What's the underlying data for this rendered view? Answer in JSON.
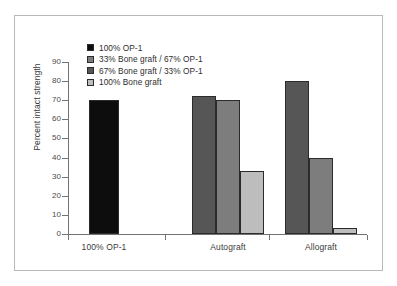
{
  "chart_data": {
    "type": "bar",
    "title": "",
    "xlabel": "",
    "ylabel": "Percent intact strength",
    "ylim": [
      0,
      90
    ],
    "ytick_step": 10,
    "yticks": [
      90,
      80,
      70,
      60,
      50,
      40,
      30,
      20,
      10,
      0
    ],
    "grid": false,
    "legend_position": "top-left",
    "categories": [
      "100% OP-1",
      "Autograft",
      "Allograft"
    ],
    "series": [
      {
        "name": "100% OP-1",
        "color": "#0d0d0d",
        "values": [
          70,
          null,
          null
        ]
      },
      {
        "name": "33% Bone graft / 67% OP-1",
        "color": "#7d7d7d",
        "values": [
          null,
          70,
          40
        ]
      },
      {
        "name": "67% Bone graft / 33% OP-1",
        "color": "#565656",
        "values": [
          null,
          72,
          80
        ]
      },
      {
        "name": "100% Bone graft",
        "color": "#bdbdbd",
        "values": [
          null,
          33,
          3
        ]
      }
    ],
    "bars": [
      {
        "category": "100% OP-1",
        "series": "100% OP-1",
        "value": 70,
        "color": "#0d0d0d",
        "x": 74,
        "width": 30
      },
      {
        "category": "Autograft",
        "series": "67% Bone graft / 33% OP-1",
        "value": 72,
        "color": "#565656",
        "x": 177,
        "width": 24
      },
      {
        "category": "Autograft",
        "series": "33% Bone graft / 67% OP-1",
        "value": 70,
        "color": "#7d7d7d",
        "x": 201,
        "width": 24
      },
      {
        "category": "Autograft",
        "series": "100% Bone graft",
        "value": 33,
        "color": "#bdbdbd",
        "x": 225,
        "width": 24
      },
      {
        "category": "Allograft",
        "series": "67% Bone graft / 33% OP-1",
        "value": 80,
        "color": "#565656",
        "x": 270,
        "width": 24
      },
      {
        "category": "Allograft",
        "series": "33% Bone graft / 67% OP-1",
        "value": 40,
        "color": "#7d7d7d",
        "x": 294,
        "width": 24
      },
      {
        "category": "Allograft",
        "series": "100% Bone graft",
        "value": 3,
        "color": "#bdbdbd",
        "x": 318,
        "width": 24
      }
    ]
  },
  "legend": {
    "items": [
      {
        "label": "100% OP-1",
        "color": "#0d0d0d"
      },
      {
        "label": "33% Bone graft / 67% OP-1",
        "color": "#7d7d7d"
      },
      {
        "label": "67% Bone graft / 33% OP-1",
        "color": "#565656"
      },
      {
        "label": "100% Bone graft",
        "color": "#bdbdbd"
      }
    ]
  },
  "axes": {
    "y_title": "Percent intact strength"
  }
}
